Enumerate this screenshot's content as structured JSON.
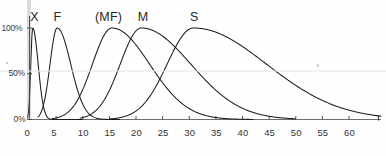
{
  "chart_data": {
    "type": "line",
    "title": "",
    "subtitle": "",
    "xlabel": "",
    "ylabel": "",
    "xlim": [
      0,
      66
    ],
    "ylim": [
      0,
      110
    ],
    "grid": false,
    "legend_position": "inline-above-peaks",
    "x_ticks": [
      0,
      5,
      10,
      15,
      20,
      25,
      30,
      35,
      40,
      45,
      50,
      55,
      60
    ],
    "x_tick_labels": [
      "0",
      "5",
      "10",
      "15",
      "20",
      "25",
      "30",
      "35",
      "40",
      "45",
      "50",
      "55",
      "60"
    ],
    "y_ticks": [
      0,
      50,
      100
    ],
    "y_tick_labels": [
      "0%",
      "50%",
      "100%"
    ],
    "annotations": [
      {
        "text": "X",
        "x": 0.8,
        "y": 112
      },
      {
        "text": "F",
        "x": 5.2,
        "y": 112
      },
      {
        "text": "(MF)",
        "x": 15.0,
        "y": 112
      },
      {
        "text": "M",
        "x": 21.0,
        "y": 112
      },
      {
        "text": "S",
        "x": 30.8,
        "y": 112
      }
    ],
    "series": [
      {
        "name": "X",
        "label": "X",
        "color": "#1d1d1d",
        "peak_x": 0.6,
        "peak_y": 100,
        "rise_width": 0.5,
        "decay_width": 1.05,
        "x_start": -0.4,
        "x_end": 10,
        "points_x": [
          0.0,
          0.2,
          0.4,
          0.6,
          0.8,
          1.0,
          1.3,
          1.6,
          2.0,
          2.5,
          3.0,
          3.6,
          4.3,
          5.2,
          6.5,
          8.0,
          10.0
        ],
        "points_y": [
          8,
          52,
          92,
          100,
          96,
          85,
          62,
          42,
          24,
          12,
          6,
          3,
          1.5,
          0.8,
          0.4,
          0.2,
          0.0
        ]
      },
      {
        "name": "F",
        "label": "F",
        "color": "#1d1d1d",
        "peak_x": 5.2,
        "peak_y": 100,
        "rise_width": 1.9,
        "decay_width": 2.6,
        "x_start": 1.6,
        "x_end": 17,
        "points_x": [
          1.8,
          2.4,
          3.0,
          3.6,
          4.2,
          4.8,
          5.2,
          5.8,
          6.4,
          7.2,
          8.0,
          9.0,
          10.2,
          11.6,
          13.0,
          15.0,
          17.0
        ],
        "points_y": [
          0,
          6,
          20,
          45,
          74,
          95,
          100,
          94,
          80,
          59,
          40,
          24,
          12,
          6,
          3,
          1,
          0
        ]
      },
      {
        "name": "(MF)",
        "label": "(MF)",
        "color": "#1d1d1d",
        "peak_x": 15.5,
        "peak_y": 100,
        "rise_width": 5.2,
        "decay_width": 7.2,
        "x_start": 4.3,
        "x_end": 42,
        "points_x": [
          4.5,
          6.0,
          7.5,
          9.0,
          10.5,
          12.0,
          13.5,
          15.5,
          17.0,
          19.0,
          21.0,
          23.5,
          26.0,
          29.0,
          32.0,
          36.0,
          40.0,
          42.0
        ],
        "points_y": [
          0,
          7,
          17,
          30,
          47,
          66,
          85,
          100,
          96,
          82,
          64,
          45,
          30,
          17,
          9,
          3.5,
          1,
          0
        ]
      },
      {
        "name": "M",
        "label": "M",
        "color": "#1d1d1d",
        "peak_x": 21.0,
        "peak_y": 100,
        "rise_width": 5.6,
        "decay_width": 9.5,
        "x_start": 9.5,
        "x_end": 50,
        "points_x": [
          9.8,
          11.5,
          13.0,
          14.5,
          16.0,
          17.5,
          19.0,
          21.0,
          23.0,
          25.5,
          28.0,
          31.0,
          34.0,
          38.0,
          42.0,
          46.0,
          50.0
        ],
        "points_y": [
          0,
          6,
          14,
          26,
          42,
          60,
          80,
          100,
          96,
          82,
          66,
          46,
          30,
          16,
          7,
          2.5,
          0
        ]
      },
      {
        "name": "S",
        "label": "S",
        "color": "#1d1d1d",
        "peak_x": 30.8,
        "peak_y": 100,
        "rise_width": 7.0,
        "decay_width": 14.0,
        "x_start": 15.0,
        "x_end": 66,
        "points_x": [
          15.0,
          17.5,
          20.0,
          22.5,
          24.5,
          26.5,
          28.5,
          30.8,
          33.0,
          36.0,
          39.0,
          43.0,
          47.0,
          52.0,
          57.0,
          62.0,
          66.0
        ],
        "points_y": [
          0,
          5,
          13,
          26,
          41,
          60,
          82,
          100,
          97,
          86,
          72,
          54,
          38,
          22,
          12,
          5,
          2
        ]
      }
    ]
  },
  "axes": {
    "y_axis_name": "percentage-axis",
    "x_axis_name": "value-axis"
  }
}
